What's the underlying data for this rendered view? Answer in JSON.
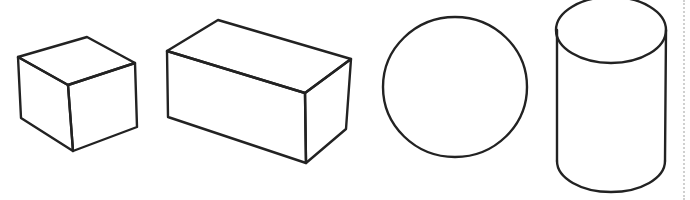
{
  "figure": {
    "stroke_color": "#222222",
    "background": "#ffffff",
    "shapes": [
      {
        "id": "cube",
        "label": "Cube"
      },
      {
        "id": "rectangular-prism",
        "label": "Rectangular prism"
      },
      {
        "id": "sphere",
        "label": "Sphere"
      },
      {
        "id": "cylinder",
        "label": "Cylinder"
      }
    ]
  }
}
